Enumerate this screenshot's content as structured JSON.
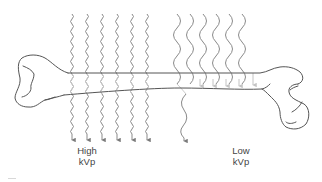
{
  "diagram": {
    "groups": [
      {
        "id": "high",
        "label_line1": "High",
        "label_line2": "kVp",
        "beam_count": 6,
        "beam_style": "short-wavelength wavy arrows, all penetrate bone",
        "penetrating_beams": 6
      },
      {
        "id": "low",
        "label_line1": "Low",
        "label_line2": "kVp",
        "beam_count": 6,
        "beam_style": "long-wavelength wavy arrows, absorbed in bone",
        "penetrating_beams": 1
      }
    ],
    "colors": {
      "bone_outline": "#555555",
      "beam": "#8a8a8a",
      "beam_faded": "#c8c8c8",
      "text": "#444444",
      "background": "#ffffff"
    }
  }
}
